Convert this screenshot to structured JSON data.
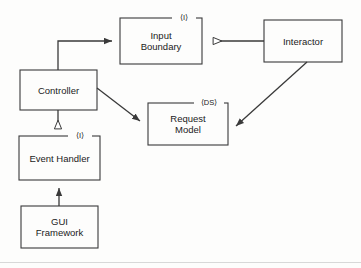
{
  "diagram": {
    "background_color": "#fdfdfc",
    "stroke_color": "#3a3a3a",
    "text_color": "#1b1b1b",
    "nodes": [
      {
        "id": "input-boundary",
        "label": "Input\nBoundary",
        "stereotype": "⟨I⟩",
        "x": 120,
        "y": 18,
        "w": 82,
        "h": 46
      },
      {
        "id": "interactor",
        "label": "Interactor",
        "stereotype": "",
        "x": 264,
        "y": 20,
        "w": 78,
        "h": 42
      },
      {
        "id": "controller",
        "label": "Controller",
        "stereotype": "",
        "x": 20,
        "y": 70,
        "w": 77,
        "h": 40
      },
      {
        "id": "request-model",
        "label": "Request\nModel",
        "stereotype": "⟨DS⟩",
        "x": 148,
        "y": 103,
        "w": 80,
        "h": 42
      },
      {
        "id": "event-handler",
        "label": "Event Handler",
        "stereotype": "⟨I⟩",
        "x": 19,
        "y": 136,
        "w": 81,
        "h": 44
      },
      {
        "id": "gui-framework",
        "label": "GUI\nFramework",
        "stereotype": "",
        "x": 21,
        "y": 206,
        "w": 77,
        "h": 42
      }
    ],
    "edges": [
      {
        "id": "controller-to-input-boundary",
        "from": "controller",
        "to": "input-boundary",
        "arrowhead": "solid",
        "style": "orthogonal"
      },
      {
        "id": "interactor-to-input-boundary",
        "from": "interactor",
        "to": "input-boundary",
        "arrowhead": "hollow",
        "style": "straight"
      },
      {
        "id": "controller-to-request-model",
        "from": "controller",
        "to": "request-model",
        "arrowhead": "solid",
        "style": "diagonal"
      },
      {
        "id": "interactor-to-request-model",
        "from": "interactor",
        "to": "request-model",
        "arrowhead": "solid",
        "style": "diagonal"
      },
      {
        "id": "controller-to-event-handler",
        "from": "controller",
        "to": "event-handler",
        "arrowhead": "hollow",
        "style": "vertical"
      },
      {
        "id": "gui-framework-to-event-handler",
        "from": "gui-framework",
        "to": "event-handler",
        "arrowhead": "solid",
        "style": "vertical"
      }
    ]
  }
}
